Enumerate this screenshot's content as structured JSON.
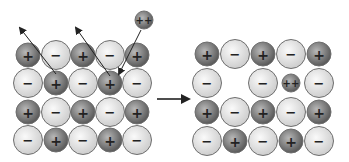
{
  "diagram": {
    "colors": {
      "cation_fill_center": "#9a9a9a",
      "cation_fill_edge": "#555555",
      "anion_fill_center": "#f4f4f4",
      "anion_fill_edge": "#cfcfcf",
      "outline": "#6e6e6e",
      "arrow": "#222222"
    },
    "radii": {
      "cation": 12,
      "anion": 14.5,
      "divalent": 9
    },
    "left_lattice": {
      "columns_x": [
        28,
        56,
        83,
        110,
        137
      ],
      "rows_y": [
        55,
        83,
        112,
        140
      ],
      "grid": [
        [
          "+",
          "-",
          "+",
          "-",
          "+"
        ],
        [
          "-",
          "+",
          "-",
          "+",
          "-"
        ],
        [
          "+",
          "-",
          "+",
          "-",
          "+"
        ],
        [
          "-",
          "+",
          "-",
          "+",
          "-"
        ]
      ],
      "incoming_ion": {
        "label": "++",
        "x": 144,
        "y": 20
      },
      "arrows": [
        {
          "name": "ejected-cation-arrow-1",
          "from": [
            56,
            74
          ],
          "to": [
            20,
            28
          ]
        },
        {
          "name": "ejected-cation-arrow-2",
          "from": [
            110,
            76
          ],
          "to": [
            76,
            28
          ]
        },
        {
          "name": "incoming-ion-arrow",
          "from": [
            141,
            30
          ],
          "to": [
            119,
            74
          ]
        }
      ]
    },
    "transition_arrow": {
      "from": [
        157,
        99
      ],
      "to": [
        189,
        99
      ]
    },
    "right_lattice": {
      "columns_x": [
        207,
        235,
        263,
        291,
        319
      ],
      "rows_y": [
        54,
        83,
        112,
        141
      ],
      "grid": [
        [
          "+",
          "-",
          "+",
          "-",
          "+"
        ],
        [
          "-",
          "",
          "-",
          "++",
          "-"
        ],
        [
          "+",
          "-",
          "+",
          "-",
          "+"
        ],
        [
          "-",
          "+",
          "-",
          "+",
          "-"
        ]
      ]
    },
    "labels": {
      "plus": "+",
      "minus": "−",
      "double_plus": "++"
    }
  }
}
